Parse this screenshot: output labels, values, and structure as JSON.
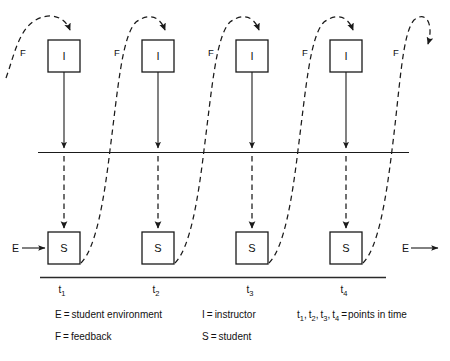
{
  "diagram": {
    "instructor_boxes": [
      {
        "label": "I",
        "x": 48,
        "y": 40
      },
      {
        "label": "I",
        "x": 142,
        "y": 40
      },
      {
        "label": "I",
        "x": 236,
        "y": 40
      },
      {
        "label": "I",
        "x": 330,
        "y": 40
      }
    ],
    "student_boxes": [
      {
        "label": "S",
        "x": 48,
        "y": 232
      },
      {
        "label": "S",
        "x": 142,
        "y": 232
      },
      {
        "label": "S",
        "x": 236,
        "y": 232
      },
      {
        "label": "S",
        "x": 330,
        "y": 232
      }
    ],
    "feedback_labels": [
      {
        "label": "F",
        "x": 20,
        "y": 53
      },
      {
        "label": "F",
        "x": 114,
        "y": 53
      },
      {
        "label": "F",
        "x": 208,
        "y": 53
      },
      {
        "label": "F",
        "x": 302,
        "y": 53
      },
      {
        "label": "F",
        "x": 393,
        "y": 53
      }
    ],
    "environment_labels": [
      {
        "label": "E",
        "x": 12,
        "y": 251,
        "side": "left"
      },
      {
        "label": "E",
        "x": 402,
        "y": 251,
        "side": "right"
      }
    ],
    "time_labels": [
      {
        "base": "t",
        "sub": "1",
        "x": 62,
        "y": 291
      },
      {
        "base": "t",
        "sub": "2",
        "x": 156,
        "y": 291
      },
      {
        "base": "t",
        "sub": "3",
        "x": 250,
        "y": 291
      },
      {
        "base": "t",
        "sub": "4",
        "x": 344,
        "y": 291
      }
    ]
  },
  "legend": {
    "column1": [
      {
        "key": "E",
        "eq": "=",
        "value": "student environment"
      },
      {
        "key": "F",
        "eq": "=",
        "value": "feedback"
      }
    ],
    "column2": [
      {
        "key": "I",
        "eq": "=",
        "value": "instructor"
      },
      {
        "key": "S",
        "eq": "=",
        "value": "student"
      }
    ],
    "column3": [
      {
        "keys": "t1, t2, t3, t4",
        "eq": "=",
        "value": "points in time"
      }
    ],
    "column3_parts": {
      "t": "t",
      "s1": "1",
      "s2": "2",
      "s3": "3",
      "s4": "4",
      "comma": ",",
      "eq": "=",
      "value": "points in time"
    }
  },
  "colors": {
    "ink": "#1a1a1a",
    "background": "#ffffff"
  }
}
